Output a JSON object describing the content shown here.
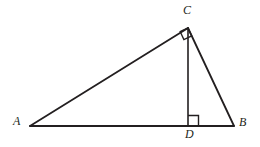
{
  "figure": {
    "background_color": "#ffffff",
    "stroke_color": "#231f20",
    "labels": {
      "A": "A",
      "B": "B",
      "C": "C",
      "D": "D"
    },
    "points": {
      "A": {
        "x": 30,
        "y": 126
      },
      "B": {
        "x": 234,
        "y": 126
      },
      "C": {
        "x": 188,
        "y": 28
      },
      "D": {
        "x": 188,
        "y": 126
      }
    },
    "segments": [
      {
        "name": "AB",
        "from": "A",
        "to": "B",
        "width": 1.8
      },
      {
        "name": "AC",
        "from": "A",
        "to": "C",
        "width": 1.8
      },
      {
        "name": "CB",
        "from": "C",
        "to": "B",
        "width": 1.8
      },
      {
        "name": "CD",
        "from": "C",
        "to": "D",
        "width": 1.6
      }
    ],
    "right_angle_marks": [
      {
        "name": "right-angle-at-C",
        "at": "C",
        "points": "188,28 180.2,31.7 183.9,39.6 191.7,36.0"
      },
      {
        "name": "right-angle-at-D",
        "at": "D",
        "points": "188,126 188,115.5 198.5,115.5 198.5,126"
      }
    ]
  }
}
